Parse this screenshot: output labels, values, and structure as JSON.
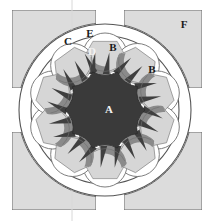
{
  "figure": {
    "type": "technical-cross-section-diagram",
    "canvas": {
      "width": 209,
      "height": 221
    }
  },
  "colors": {
    "background": "#ffffff",
    "frame_block_fill": "#dcdcdc",
    "frame_block_stroke": "#6b6b6b",
    "housing_fill": "#ffffff",
    "housing_stroke": "#555555",
    "hub_fill": "#3a3a3a",
    "hub_stroke": "#2a2a2a",
    "blade_dark": "#3f3f3f",
    "blade_mid": "#8a8a8a",
    "blade_light": "#d6d6d6",
    "cell_fill": "#ffffff",
    "cell_stroke": "#6f6f6f",
    "guideline": "#d8d8d8",
    "label_dark": "#1a1a1a",
    "label_light": "#f2f2f2"
  },
  "labels": [
    {
      "id": "A",
      "text": "A",
      "x": 109,
      "y": 110,
      "tone": "light",
      "refers_to": "central-hub-chamber"
    },
    {
      "id": "B1",
      "text": "B",
      "x": 113,
      "y": 48,
      "tone": "dark",
      "refers_to": "vane-cell-pocket"
    },
    {
      "id": "B2",
      "text": "B",
      "x": 152,
      "y": 70,
      "tone": "dark",
      "refers_to": "vane-cell-pocket"
    },
    {
      "id": "C",
      "text": "C",
      "x": 68,
      "y": 42,
      "tone": "dark",
      "refers_to": "outer-housing-ring"
    },
    {
      "id": "D",
      "text": "D",
      "x": 92,
      "y": 52,
      "tone": "light",
      "refers_to": "blade-dark-wedge"
    },
    {
      "id": "E",
      "text": "E",
      "x": 90,
      "y": 34,
      "tone": "dark",
      "refers_to": "blade-tip"
    },
    {
      "id": "F",
      "text": "F",
      "x": 184,
      "y": 25,
      "tone": "dark",
      "refers_to": "corner-frame-block"
    }
  ],
  "geometry": {
    "center": {
      "x": 105,
      "y": 110
    },
    "housing_outer_radius": 86,
    "housing_inner_radius": 74,
    "cell_ring_radius": 55,
    "cell_radius": 22,
    "hub_radius": 40,
    "vane_count": 10,
    "vane_start_angle_deg": -90,
    "hub_lobes": 10
  },
  "frame_blocks": [
    {
      "id": "top-left",
      "x": 12,
      "y": 10,
      "w": 84,
      "h": 78,
      "cut": "bottom-right"
    },
    {
      "id": "top-right",
      "x": 124,
      "y": 10,
      "w": 78,
      "h": 78,
      "cut": "bottom-left"
    },
    {
      "id": "bottom-left",
      "x": 12,
      "y": 132,
      "w": 84,
      "h": 78,
      "cut": "top-right"
    },
    {
      "id": "bottom-right",
      "x": 124,
      "y": 132,
      "w": 78,
      "h": 78,
      "cut": "top-left"
    }
  ],
  "guidelines": [
    {
      "id": "vertical-center",
      "x1": 72,
      "y1": 0,
      "x2": 72,
      "y2": 221
    }
  ]
}
